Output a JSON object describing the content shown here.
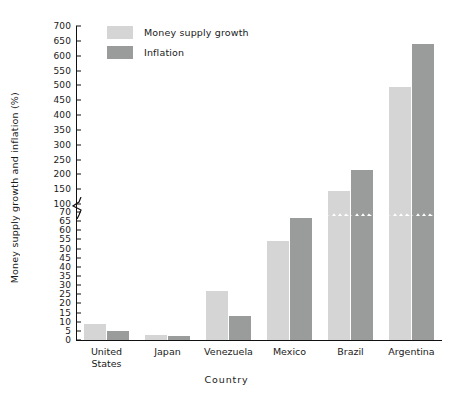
{
  "chart_data": {
    "type": "bar",
    "title": "",
    "xlabel": "Country",
    "ylabel": "Money supply growth and inflation (%)",
    "categories": [
      "United States",
      "Japan",
      "Venezuela",
      "Mexico",
      "Brazil",
      "Argentina"
    ],
    "category_lines": [
      [
        "United",
        "States"
      ],
      [
        "Japan"
      ],
      [
        "Venezuela"
      ],
      [
        "Mexico"
      ],
      [
        "Brazil"
      ],
      [
        "Argentina"
      ]
    ],
    "series": [
      {
        "name": "Money supply growth",
        "color": "#d5d5d5",
        "values": [
          9,
          3,
          27,
          54,
          145,
          495
        ]
      },
      {
        "name": "Inflation",
        "color": "#9a9b9b",
        "values": [
          5,
          2,
          13,
          67,
          215,
          640
        ]
      }
    ],
    "axis_break": true,
    "axis_break_between": [
      70,
      100
    ],
    "lower_ticks": [
      0,
      5,
      10,
      15,
      20,
      25,
      30,
      35,
      40,
      45,
      50,
      55,
      60,
      65,
      70
    ],
    "upper_ticks": [
      100,
      150,
      200,
      250,
      300,
      350,
      400,
      450,
      500,
      550,
      600,
      650,
      700
    ],
    "ylim": [
      0,
      700
    ],
    "grid": false,
    "legend_position": "top-left"
  },
  "legend": {
    "items": [
      {
        "label": "Money supply growth"
      },
      {
        "label": "Inflation"
      }
    ]
  }
}
